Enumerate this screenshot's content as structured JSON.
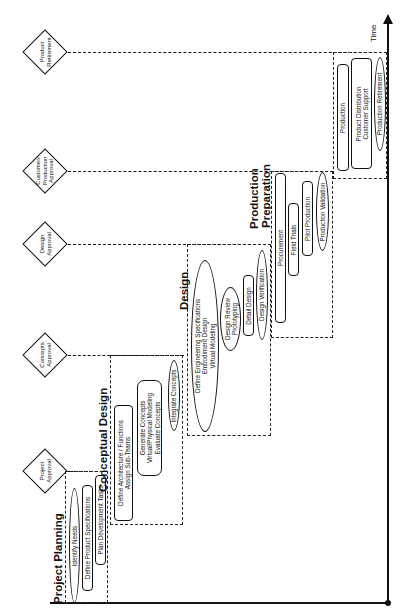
{
  "axis": {
    "label": "Time"
  },
  "milestones": [
    {
      "label_lines": [
        "Product",
        "Retirement"
      ]
    },
    {
      "label_lines": [
        "Customer/",
        "Production",
        "Approval"
      ]
    },
    {
      "label_lines": [
        "Design",
        "Approval"
      ]
    },
    {
      "label_lines": [
        "Concepts",
        "Approval"
      ]
    },
    {
      "label_lines": [
        "Project",
        "Approval"
      ]
    }
  ],
  "stages": [
    {
      "title": "Project Planning",
      "tasks": [
        {
          "lines": [
            "Identify Needs"
          ],
          "shape": "ellipse"
        },
        {
          "lines": [
            "Define Product Specifications"
          ],
          "shape": "box"
        },
        {
          "lines": [
            "Plan Development Tasks"
          ],
          "shape": "box"
        }
      ]
    },
    {
      "title": "Conceptual Design",
      "tasks": [
        {
          "lines": [
            "Define Architecture / Functions",
            "Assign Sub-Teams"
          ],
          "shape": "box"
        },
        {
          "lines": [
            "Generate Concepts",
            "Virtual/Physical Modeling",
            "Evaluate Concepts"
          ],
          "shape": "box"
        },
        {
          "lines": [
            "Integrate Concepts"
          ],
          "shape": "ellipse"
        }
      ]
    },
    {
      "title": "Design",
      "tasks": [
        {
          "lines": [
            "Define Engineering Specifications",
            "Embodiment Design",
            "Virtual Modeling"
          ],
          "shape": "ellipse"
        },
        {
          "lines": [
            "Design Review",
            "Prototyping"
          ],
          "shape": "ellipse"
        },
        {
          "lines": [
            "Detail Design"
          ],
          "shape": "box"
        },
        {
          "lines": [
            "Design Verification"
          ],
          "shape": "ellipse"
        }
      ]
    },
    {
      "title_lines": [
        "Production",
        "Preparation"
      ],
      "tasks": [
        {
          "lines": [
            "Procurement"
          ],
          "shape": "box"
        },
        {
          "lines": [
            "Field Trials"
          ],
          "shape": "box"
        },
        {
          "lines": [
            "Pilot Production"
          ],
          "shape": "box"
        },
        {
          "lines": [
            "Production Validation"
          ],
          "shape": "ellipse"
        }
      ]
    },
    {
      "title": "",
      "tasks": [
        {
          "lines": [
            "Production"
          ],
          "shape": "box"
        },
        {
          "lines": [
            "Product Distribution",
            "Customer Support"
          ],
          "shape": "box"
        },
        {
          "lines": [
            "Production Retirement"
          ],
          "shape": "ellipse"
        }
      ]
    }
  ]
}
